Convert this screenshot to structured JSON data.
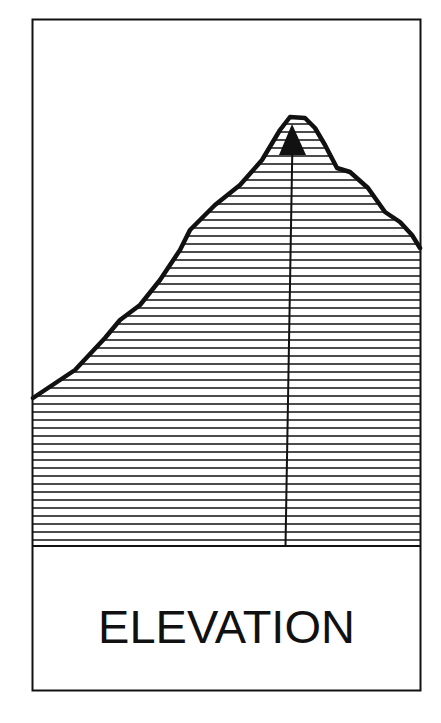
{
  "card": {
    "label": "ELEVATION",
    "colors": {
      "ink": "#111111",
      "background": "#ffffff"
    }
  },
  "illustration": {
    "subject": "mountain elevation profile",
    "fill_pattern": "horizontal-hatch",
    "peak_marker": "triangle-icon",
    "has_vertical_line_from_peak": true
  }
}
